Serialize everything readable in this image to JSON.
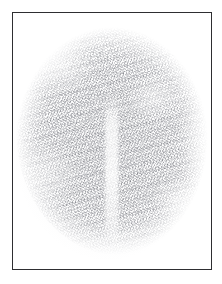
{
  "image": {
    "title": "Framed scribble texture plate",
    "description": "A thin dark rectangular frame on a white margin enclosing a large rounded mass of dense, fine pencil-like scribble texture in pale grey.",
    "background_color": "#ffffff",
    "frame": {
      "name": "frame-border",
      "color": "#2e2e31",
      "stroke_width_px": 1.4,
      "left_px": 12,
      "top_px": 12,
      "width_px": 200,
      "height_px": 258
    },
    "subject": {
      "name": "scribble-mass",
      "shape": "rounded-ovoid",
      "fill_description": "dense overlapping fine hatch strokes",
      "ink_color": "#7a7c84",
      "average_tone": "#ededf0",
      "left_px": 16,
      "top_px": 28,
      "width_px": 192,
      "height_px": 228,
      "edge": "soft feathered falloff into white",
      "features": [
        {
          "name": "central-fissure",
          "description": "pale vertical gap running down the lower centre of the mass"
        },
        {
          "name": "mottled-density",
          "description": "irregular lighter and darker patches across the texture"
        }
      ]
    },
    "margin": {
      "name": "paper-margin",
      "color": "#ffffff",
      "size_px": 12
    }
  }
}
